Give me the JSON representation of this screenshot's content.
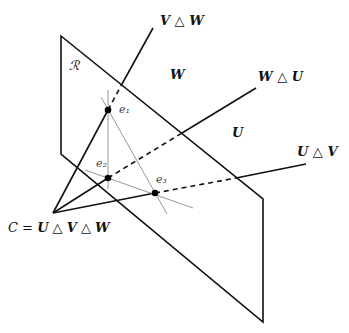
{
  "diagram": {
    "type": "projective-plane-diagram",
    "plane_label": "ℛ",
    "region_labels": {
      "W": "W",
      "U": "U"
    },
    "ray_labels": {
      "v_w": "V △ W",
      "w_u": "W △ U",
      "u_v": "U △ V"
    },
    "point_labels": {
      "e1": "e₁",
      "e2": "e₂",
      "e3": "e₃"
    },
    "apex_label": {
      "c": "C",
      "eq": " = ",
      "u": "U",
      "op1": " △ ",
      "v": "V",
      "op2": " △ ",
      "w": "W"
    },
    "colors": {
      "ink": "#111111",
      "thin_lines": "#8a8a8a",
      "background": "#ffffff"
    }
  }
}
